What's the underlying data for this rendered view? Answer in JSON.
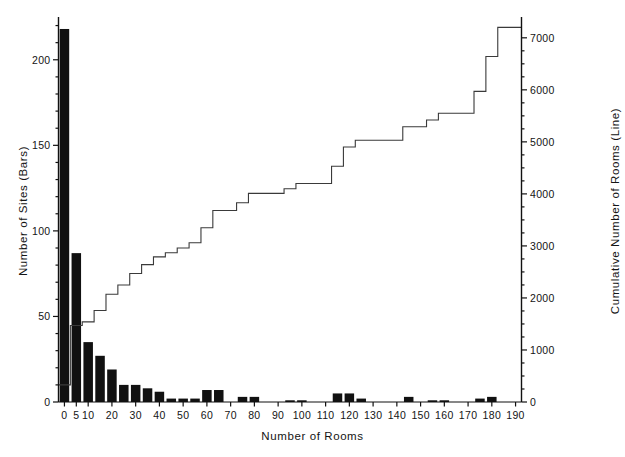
{
  "chart_data": {
    "type": "bar",
    "title": "",
    "xlabel": "Number of Rooms",
    "ylabel": "Number of Sites (Bars)",
    "y2label": "Cumulative Number of Rooms (Line)",
    "grid": false,
    "legend": "none",
    "bin_width": 5,
    "xlim": [
      -2.5,
      192.5
    ],
    "ylim": [
      0,
      225
    ],
    "y2lim": [
      0,
      7400
    ],
    "xticks": [
      0,
      5,
      10,
      20,
      30,
      40,
      50,
      60,
      70,
      80,
      90,
      100,
      110,
      120,
      130,
      140,
      150,
      160,
      170,
      180,
      190
    ],
    "xtick_labels": [
      "0",
      "5",
      "10",
      "20",
      "30",
      "40",
      "50",
      "60",
      "70",
      "80",
      "90",
      "100",
      "110",
      "120",
      "130",
      "140",
      "150",
      "160",
      "170",
      "180",
      "190"
    ],
    "yticks": [
      0,
      50,
      100,
      150,
      200
    ],
    "ytick_labels": [
      "0",
      "50",
      "100",
      "150",
      "200"
    ],
    "yminorticks": [
      10,
      20,
      30,
      40,
      60,
      70,
      80,
      90,
      110,
      120,
      130,
      140,
      160,
      170,
      180,
      190,
      210,
      220
    ],
    "y2ticks": [
      0,
      1000,
      2000,
      3000,
      4000,
      5000,
      6000,
      7000
    ],
    "y2tick_labels": [
      "0",
      "1000",
      "2000",
      "3000",
      "4000",
      "5000",
      "6000",
      "7000"
    ],
    "y2minorticks": [
      250,
      500,
      750,
      1250,
      1500,
      1750,
      2250,
      2500,
      2750,
      3250,
      3500,
      3750,
      4250,
      4500,
      4750,
      5250,
      5500,
      5750,
      6250,
      6500,
      6750
    ],
    "categories": [
      0,
      5,
      10,
      15,
      20,
      25,
      30,
      35,
      40,
      45,
      50,
      55,
      60,
      65,
      70,
      75,
      80,
      85,
      90,
      95,
      100,
      105,
      110,
      115,
      120,
      125,
      130,
      135,
      140,
      145,
      150,
      155,
      160,
      165,
      170,
      175,
      180,
      185,
      190
    ],
    "series": [
      {
        "name": "Number of Sites (Bars)",
        "type": "bar",
        "axis": "left",
        "color": "#111111",
        "values": [
          218,
          87,
          35,
          27,
          19,
          10,
          10,
          8,
          6,
          2,
          2,
          2,
          7,
          7,
          0,
          3,
          3,
          0,
          0,
          1,
          1,
          0,
          0,
          5,
          5,
          2,
          0,
          0,
          0,
          3,
          0,
          1,
          1,
          0,
          0,
          2,
          3,
          0,
          0
        ]
      },
      {
        "name": "Cumulative Number of Rooms (Line)",
        "type": "step",
        "axis": "right",
        "color": "#3a3a3a",
        "values": [
          330,
          1470,
          1540,
          1760,
          2070,
          2250,
          2470,
          2640,
          2790,
          2870,
          2960,
          3060,
          3350,
          3680,
          3680,
          3830,
          4010,
          4010,
          4010,
          4100,
          4200,
          4200,
          4200,
          4530,
          4900,
          5030,
          5030,
          5030,
          5030,
          5290,
          5290,
          5420,
          5550,
          5550,
          5550,
          5970,
          6640,
          7200,
          7200
        ]
      }
    ]
  }
}
